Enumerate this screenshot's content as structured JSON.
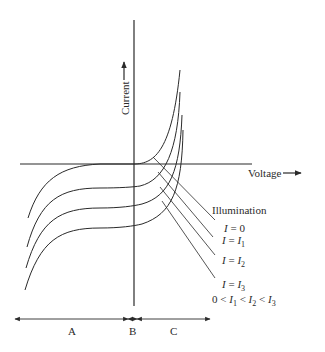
{
  "diagram": {
    "type": "photodiode I-V characteristic",
    "axes": {
      "y_label": "Current",
      "x_label": "Voltage"
    },
    "legend": {
      "title": "Illumination",
      "entries": [
        {
          "lhs": "I",
          "rhs": "0",
          "sub": ""
        },
        {
          "lhs": "I",
          "rhs": "I",
          "sub": "1"
        },
        {
          "lhs": "I",
          "rhs": "I",
          "sub": "2"
        },
        {
          "lhs": "I",
          "rhs": "I",
          "sub": "3"
        }
      ],
      "condition": {
        "prefix": "0 < ",
        "t1": "I",
        "s1": "1",
        "lt": " < ",
        "t2": "I",
        "s2": "2",
        "t3": "I",
        "s3": "3"
      }
    },
    "regions": [
      {
        "label": "A"
      },
      {
        "label": "B"
      },
      {
        "label": "C"
      }
    ],
    "colors": {
      "line": "#2a2a2a",
      "background": "#ffffff"
    }
  }
}
